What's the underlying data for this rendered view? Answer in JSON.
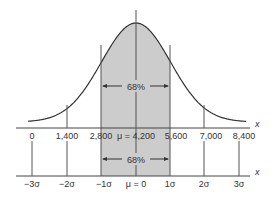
{
  "chart_data": {
    "type": "area",
    "title": "",
    "mean": 4200,
    "std_dev": 1400,
    "shaded_range": [
      2800,
      5600
    ],
    "shaded_percent_label": "68%",
    "axes": [
      {
        "name": "x",
        "label": "x",
        "ticks": [
          0,
          1400,
          2800,
          4200,
          5600,
          7000,
          8400
        ],
        "tick_labels": [
          "0",
          "1,400",
          "2,800",
          "μ = 4,200",
          "5,600",
          "7,000",
          "8,400"
        ]
      },
      {
        "name": "z",
        "label": "x",
        "ticks": [
          -3,
          -2,
          -1,
          0,
          1,
          2,
          3
        ],
        "tick_labels": [
          "−3σ",
          "−2σ",
          "−1σ",
          "μ = 0",
          "1σ",
          "2σ",
          "3σ"
        ]
      }
    ],
    "colors": {
      "shade": "#cccccc",
      "line": "#333333"
    }
  }
}
